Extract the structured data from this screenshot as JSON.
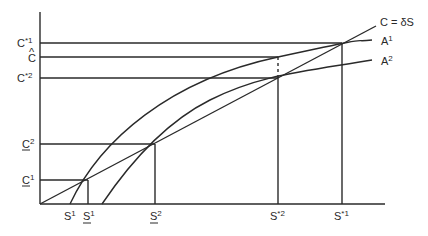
{
  "diagram": {
    "type": "economics-graph",
    "axes": {
      "y_axis": {
        "x": 40,
        "y_top": 12,
        "y_bottom": 204
      },
      "x_axis": {
        "y": 204,
        "x_left": 40,
        "x_right": 385
      }
    },
    "y_labels": [
      {
        "id": "c-star-1",
        "base": "C",
        "sup": "*1",
        "underline": false,
        "y": 43
      },
      {
        "id": "c-hat",
        "base": "C",
        "accent": "^",
        "underline": false,
        "y": 57
      },
      {
        "id": "c-star-2",
        "base": "C",
        "sup": "*2",
        "underline": false,
        "y": 78
      },
      {
        "id": "c-under-2",
        "base": "C",
        "sup": "2",
        "underline": true,
        "y": 144
      },
      {
        "id": "c-under-1",
        "base": "C",
        "sup": "1",
        "underline": true,
        "y": 180
      }
    ],
    "x_labels": [
      {
        "id": "s-1",
        "base": "S",
        "sup": "1",
        "underline": false,
        "x": 70
      },
      {
        "id": "s-under-1",
        "base": "S",
        "sup": "1",
        "underline": true,
        "x": 88
      },
      {
        "id": "s-under-2",
        "base": "S",
        "sup": "2",
        "underline": true,
        "x": 155
      },
      {
        "id": "s-star-2",
        "base": "S",
        "sup": "*2",
        "underline": false,
        "x": 278
      },
      {
        "id": "s-star-1",
        "base": "S",
        "sup": "*1",
        "underline": false,
        "x": 342
      }
    ],
    "curves": [
      {
        "id": "c-delta-s",
        "label": "C = δS",
        "kind": "line"
      },
      {
        "id": "a1",
        "label": "A",
        "label_sup": "1",
        "kind": "concave"
      },
      {
        "id": "a2",
        "label": "A",
        "label_sup": "2",
        "kind": "concave"
      }
    ],
    "curve_labels": {
      "line": "C = δS",
      "a1_base": "A",
      "a1_sup": "1",
      "a2_base": "A",
      "a2_sup": "2"
    },
    "label_text": {
      "c_base": "C",
      "s_base": "S",
      "hat": "^",
      "sup_star1": "*1",
      "sup_star2": "*2",
      "sup_1": "1",
      "sup_2": "2"
    }
  }
}
